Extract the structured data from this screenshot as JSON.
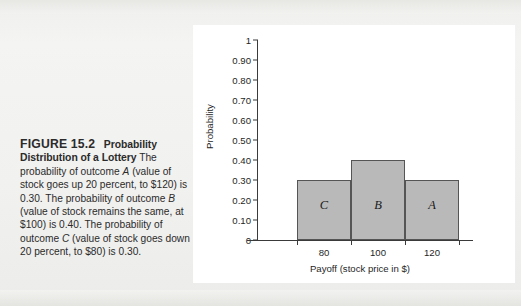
{
  "figure": {
    "label": "FIGURE 15.2",
    "title": "Probability Distribution of a Lottery",
    "caption_part1": "The probability of outcome ",
    "caption_a": "A",
    "caption_part2": " (value of stock goes up 20 percent, to $120) is 0.30. The probability of outcome ",
    "caption_b": "B",
    "caption_part3": " (value of stock remains the same, at $100) is 0.40. The probability of outcome ",
    "caption_c": "C",
    "caption_part4": " (value of stock goes down 20 percent, to $80) is 0.30.",
    "caption_full": "The probability of outcome A (value of stock goes up 20 percent, to $120) is 0.30. The probability of outcome B (value of stock remains the same, at $100) is 0.40. The probability of outcome C (value of stock goes down 20 percent, to $80) is 0.30."
  },
  "chart_data": {
    "type": "bar",
    "title": "",
    "categories": [
      "80",
      "100",
      "120"
    ],
    "values": [
      0.3,
      0.4,
      0.3
    ],
    "bar_labels": [
      "C",
      "B",
      "A"
    ],
    "xlabel": "Payoff (stock price in $)",
    "ylabel": "Probability",
    "ylim": [
      0,
      1
    ],
    "ytick_labels": [
      "1",
      "0.90",
      "0.80",
      "0.70",
      "0.60",
      "0.50",
      "0.40",
      "0.30",
      "0.20",
      "0.10",
      "0"
    ],
    "ytick_values": [
      1,
      0.9,
      0.8,
      0.7,
      0.6,
      0.5,
      0.4,
      0.3,
      0.2,
      0.1,
      0
    ],
    "xtick_labels": [
      "80",
      "100",
      "120"
    ],
    "grid": false,
    "legend": "none",
    "bar_fill_color": "#b9b9b9",
    "bar_edge_color": "#555555",
    "axis_color": "#3a3a3a",
    "panel_background": "#ffffff",
    "page_background": "#f2f2f0"
  }
}
